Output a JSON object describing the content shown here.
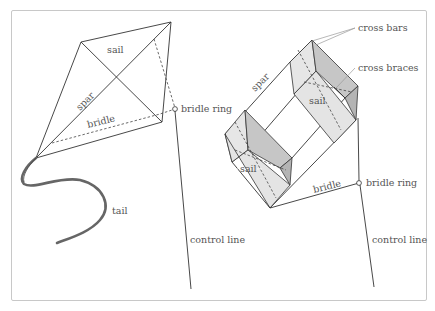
{
  "diagram": {
    "colors": {
      "line": "#333333",
      "label": "#555555",
      "sail_light": "#e4e4e4",
      "sail_mid": "#c9c9c9",
      "sail_dark": "#b0b0b0",
      "tail": "#666666",
      "frame": "#c8c8c8"
    },
    "diamond_kite": {
      "labels": {
        "sail": "sail",
        "spar": "spar",
        "bridle": "bridle",
        "bridle_ring": "bridle ring",
        "tail": "tail",
        "control_line": "control line"
      }
    },
    "box_kite": {
      "labels": {
        "cross_bars": "cross bars",
        "cross_braces": "cross braces",
        "spar": "spar",
        "sail_upper": "sail",
        "sail_lower": "sail",
        "bridle": "bridle",
        "bridle_ring": "bridle ring",
        "control_line": "control line"
      }
    }
  }
}
